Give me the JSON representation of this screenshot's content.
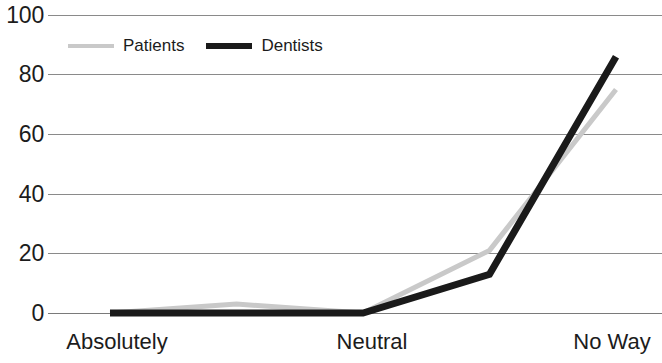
{
  "chart_data": {
    "type": "line",
    "title": "",
    "xlabel": "",
    "ylabel": "",
    "ylim": [
      0,
      100
    ],
    "yticks": [
      0,
      20,
      40,
      60,
      80,
      100
    ],
    "grid": true,
    "legend_position": "top-left-inside",
    "categories": [
      "Absolutely",
      "",
      "Neutral",
      "",
      "No Way"
    ],
    "x": [
      1,
      2,
      3,
      4,
      5
    ],
    "series": [
      {
        "name": "Patients",
        "color": "#c9c9c9",
        "values": [
          0,
          3,
          0,
          21,
          75
        ]
      },
      {
        "name": "Dentists",
        "color": "#1a1a1a",
        "values": [
          0,
          0,
          0,
          13,
          86
        ]
      }
    ]
  },
  "axis": {
    "y_tick_labels": [
      "100",
      "80",
      "60",
      "40",
      "20",
      "0"
    ],
    "x_tick_labels": [
      "Absolutely",
      "Neutral",
      "No Way"
    ]
  },
  "legend": {
    "items": [
      {
        "label": "Patients",
        "swatch": "line-swatch-gray"
      },
      {
        "label": "Dentists",
        "swatch": "line-swatch-black"
      }
    ]
  }
}
